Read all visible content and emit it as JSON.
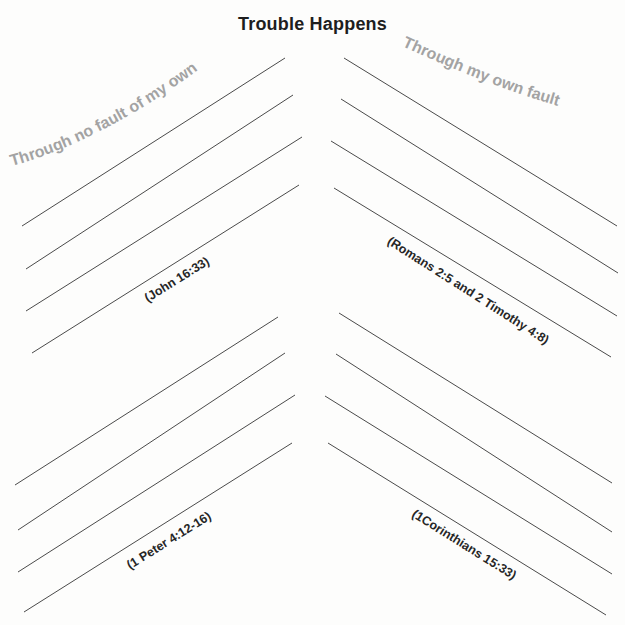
{
  "worksheet": {
    "title": "Trouble Happens",
    "left_heading": "Through no fault of my own",
    "right_heading": "Through my own fault",
    "references": {
      "top_left": "(John 16:33)",
      "top_right": "(Romans 2:5 and 2 Timothy 4:8)",
      "bottom_left": "(1 Peter 4:12-16)",
      "bottom_right": "(1Corinthians 15:33)"
    },
    "colors": {
      "title": "#1e1e1e",
      "heading_gray": "#a3a3a3",
      "reference_text": "#262626",
      "lines": "#4a4a4a",
      "background": "#fdfdfc"
    },
    "line_groups": {
      "top_left": [
        {
          "x1": 22,
          "y1": 226,
          "x2": 285,
          "y2": 58
        },
        {
          "x1": 26,
          "y1": 269,
          "x2": 293,
          "y2": 95
        },
        {
          "x1": 26,
          "y1": 311,
          "x2": 302,
          "y2": 137
        },
        {
          "x1": 32,
          "y1": 353,
          "x2": 299,
          "y2": 185
        }
      ],
      "top_right": [
        {
          "x1": 344,
          "y1": 58,
          "x2": 617,
          "y2": 226
        },
        {
          "x1": 341,
          "y1": 99,
          "x2": 618,
          "y2": 273
        },
        {
          "x1": 331,
          "y1": 141,
          "x2": 617,
          "y2": 316
        },
        {
          "x1": 334,
          "y1": 188,
          "x2": 611,
          "y2": 357
        }
      ],
      "bottom_left": [
        {
          "x1": 15,
          "y1": 485,
          "x2": 278,
          "y2": 317
        },
        {
          "x1": 18,
          "y1": 530,
          "x2": 285,
          "y2": 353
        },
        {
          "x1": 18,
          "y1": 572,
          "x2": 295,
          "y2": 395
        },
        {
          "x1": 24,
          "y1": 612,
          "x2": 292,
          "y2": 443
        }
      ],
      "bottom_right": [
        {
          "x1": 339,
          "y1": 313,
          "x2": 612,
          "y2": 483
        },
        {
          "x1": 336,
          "y1": 354,
          "x2": 612,
          "y2": 532
        },
        {
          "x1": 325,
          "y1": 396,
          "x2": 612,
          "y2": 574
        },
        {
          "x1": 328,
          "y1": 443,
          "x2": 606,
          "y2": 615
        }
      ]
    }
  }
}
